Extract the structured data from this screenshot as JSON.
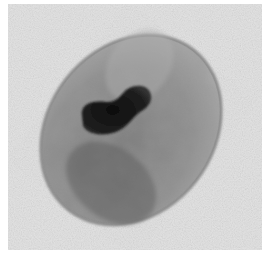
{
  "image": {
    "description": "Grayscale micrograph of an oval cell with a dark elongated nucleus",
    "colors": {
      "background_border": "#ffffff",
      "field": "#e6e6e6",
      "cell_membrane": "#8a8a8a",
      "cytoplasm_light": "#a8a8a8",
      "cytoplasm_dark": "#5a5a5a",
      "nucleus": "#1a1a1a"
    }
  }
}
